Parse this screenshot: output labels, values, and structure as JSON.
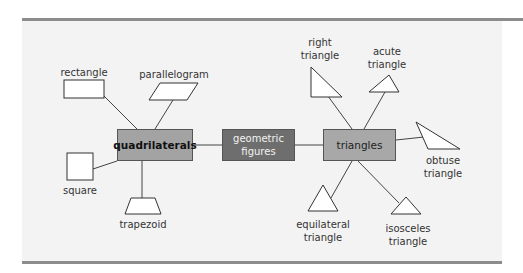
{
  "diagram": {
    "center": {
      "label_line1": "geometric",
      "label_line2": "figures",
      "fill": "#6e6e6e",
      "text_color": "#f2f2f2"
    },
    "branches": [
      {
        "id": "quadrilaterals",
        "label": "quadrilaterals",
        "fill": "#a3a3a3",
        "children": [
          {
            "id": "rectangle",
            "label": "rectangle",
            "shape": "rectangle"
          },
          {
            "id": "parallelogram",
            "label": "parallelogram",
            "shape": "parallelogram"
          },
          {
            "id": "square",
            "label": "square",
            "shape": "square"
          },
          {
            "id": "trapezoid",
            "label": "trapezoid",
            "shape": "trapezoid"
          }
        ]
      },
      {
        "id": "triangles",
        "label": "triangles",
        "fill": "#a8a8a8",
        "children": [
          {
            "id": "right-triangle",
            "label_line1": "right",
            "label_line2": "triangle",
            "shape": "right-triangle"
          },
          {
            "id": "acute-triangle",
            "label_line1": "acute",
            "label_line2": "triangle",
            "shape": "acute-triangle"
          },
          {
            "id": "obtuse-triangle",
            "label_line1": "obtuse",
            "label_line2": "triangle",
            "shape": "obtuse-triangle"
          },
          {
            "id": "equilateral-triangle",
            "label_line1": "equilateral",
            "label_line2": "triangle",
            "shape": "equilateral-triangle"
          },
          {
            "id": "isosceles-triangle",
            "label_line1": "isosceles",
            "label_line2": "triangle",
            "shape": "isosceles-triangle"
          }
        ]
      }
    ],
    "colors": {
      "panel_bg": "#f3f3f3",
      "rule": "#8c8c8c",
      "line": "#444444",
      "shape_fill": "#ffffff"
    }
  }
}
